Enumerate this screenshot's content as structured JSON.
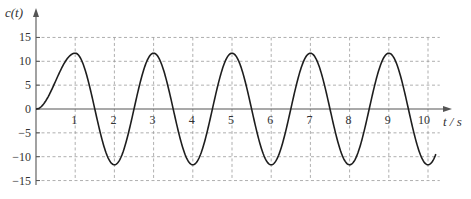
{
  "chart_data": {
    "type": "line",
    "title": "",
    "xlabel": "t / s",
    "ylabel": "c(t)",
    "xlim": [
      0,
      10.3
    ],
    "ylim": [
      -15,
      15
    ],
    "x_ticks": [
      1,
      2,
      3,
      4,
      5,
      6,
      7,
      8,
      9,
      10
    ],
    "y_ticks": [
      15,
      10,
      5,
      0,
      -5,
      -10,
      -15
    ],
    "grid": true,
    "legend": null,
    "series": [
      {
        "name": "c(t)",
        "description": "Oscillatory response starting at 0, peaks ≈11.7 at t=1,3,5,7,9; troughs ≈-11.7 at t=2,4,6,8; period 2 s",
        "x": [
          0,
          0.25,
          0.5,
          0.75,
          1,
          1.25,
          1.5,
          1.75,
          2,
          2.25,
          2.5,
          2.75,
          3,
          3.25,
          3.5,
          3.75,
          4,
          4.25,
          4.5,
          4.75,
          5,
          5.25,
          5.5,
          5.75,
          6,
          6.25,
          6.5,
          6.75,
          7,
          7.25,
          7.5,
          7.75,
          8,
          8.25,
          8.5,
          8.75,
          9,
          9.25,
          9.5,
          9.75,
          10,
          10.2
        ],
        "values": [
          0,
          1.7,
          5.9,
          10.0,
          11.7,
          8.3,
          0,
          -8.3,
          -11.7,
          -8.3,
          0,
          8.3,
          11.7,
          8.3,
          0,
          -8.3,
          -11.7,
          -8.3,
          0,
          8.3,
          11.7,
          8.3,
          0,
          -8.3,
          -11.7,
          -8.3,
          0,
          8.3,
          11.7,
          8.3,
          0,
          -8.3,
          -11.7,
          -8.3,
          0,
          8.3,
          11.7,
          8.3,
          0,
          -8.3,
          -11.7,
          -11.2
        ]
      }
    ]
  },
  "labels": {
    "y_axis_title": "c(t)",
    "x_axis_title": "t / s",
    "origin": "0"
  }
}
